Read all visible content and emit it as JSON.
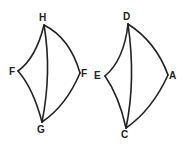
{
  "figures": [
    {
      "name": "left-figure",
      "labels": {
        "top": "H",
        "left": "F",
        "right": "F",
        "bottom": "G"
      }
    },
    {
      "name": "right-figure",
      "labels": {
        "top": "D",
        "left": "E",
        "right": "A",
        "bottom": "C"
      }
    }
  ]
}
